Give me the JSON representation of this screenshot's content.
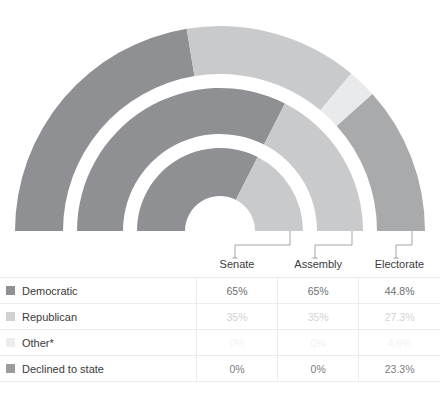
{
  "chart_data": {
    "type": "pie",
    "variant": "nested-half-donut",
    "title": "",
    "orientation": "semicircle-up",
    "categories": [
      "Democratic",
      "Republican",
      "Other*",
      "Declined to state"
    ],
    "colors": [
      "#8f9093",
      "#c9cacc",
      "#e9eaeb",
      "#a9aaac"
    ],
    "rings": [
      {
        "name": "Electorate",
        "order": "outer",
        "values": [
          44.8,
          27.3,
          4.6,
          23.3
        ]
      },
      {
        "name": "Assembly",
        "order": "middle",
        "values": [
          65,
          35,
          0,
          0
        ]
      },
      {
        "name": "Senate",
        "order": "inner",
        "values": [
          65,
          35,
          0,
          0
        ]
      }
    ],
    "units": "percent",
    "legend_position": "bottom-table"
  },
  "connectors": [
    {
      "label": "Senate",
      "ring": "inner"
    },
    {
      "label": "Assembly",
      "ring": "middle"
    },
    {
      "label": "Electorate",
      "ring": "outer"
    }
  ],
  "table": {
    "headers": [
      "",
      "Senate",
      "Assembly",
      "Electorate"
    ],
    "rows": [
      {
        "label": "Democratic",
        "swatch": "#8f9093",
        "text_color": "#6e6f71",
        "values": [
          "65%",
          "65%",
          "44.8%"
        ]
      },
      {
        "label": "Republican",
        "swatch": "#cfd0d2",
        "text_color": "#d2d3d5",
        "values": [
          "35%",
          "35%",
          "27.3%"
        ]
      },
      {
        "label": "Other*",
        "swatch": "#eceded",
        "text_color": "#f1f2f3",
        "values": [
          "0%",
          "0%",
          "4.6%"
        ]
      },
      {
        "label": "Declined to state",
        "swatch": "#9a9b9d",
        "text_color": "#7c7d7f",
        "values": [
          "0%",
          "0%",
          "23.3%"
        ]
      }
    ]
  },
  "colors": {
    "democratic": "#8f9093",
    "republican": "#c9cacc",
    "other": "#e9eaeb",
    "declined": "#a9aaac",
    "grid": "#ececec",
    "connector": "#9b9b9b",
    "background": "#ffffff"
  }
}
